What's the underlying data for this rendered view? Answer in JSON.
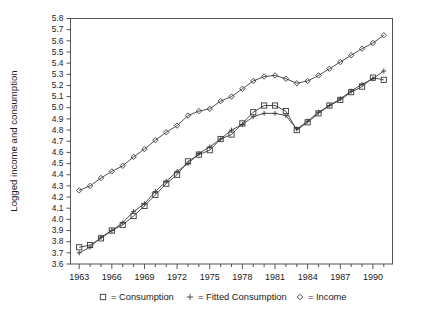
{
  "chart_data": {
    "type": "line",
    "title": "",
    "xlabel": "",
    "ylabel": "Logged income and consumption",
    "xlim": [
      1962.2,
      1991.8
    ],
    "ylim": [
      3.6,
      5.8
    ],
    "grid": false,
    "legend_position": "bottom",
    "y_ticks": [
      "3.6",
      "3.7",
      "3.8",
      "3.9",
      "4.0",
      "4.1",
      "4.2",
      "4.3",
      "4.4",
      "4.5",
      "4.6",
      "4.7",
      "4.8",
      "4.9",
      "5.0",
      "5.1",
      "5.2",
      "5.3",
      "5.4",
      "5.5",
      "5.6",
      "5.7",
      "5.8"
    ],
    "y_tick_values": [
      3.6,
      3.7,
      3.8,
      3.9,
      4.0,
      4.1,
      4.2,
      4.3,
      4.4,
      4.5,
      4.6,
      4.7,
      4.8,
      4.9,
      5.0,
      5.1,
      5.2,
      5.3,
      5.4,
      5.5,
      5.6,
      5.7,
      5.8
    ],
    "x_tick_labels": [
      "1963",
      "1966",
      "1969",
      "1972",
      "1975",
      "1978",
      "1981",
      "1984",
      "1987",
      "1990"
    ],
    "x_tick_values": [
      1963,
      1966,
      1969,
      1972,
      1975,
      1978,
      1981,
      1984,
      1987,
      1990
    ],
    "x_minor_values": [
      1964,
      1965,
      1967,
      1968,
      1970,
      1971,
      1973,
      1974,
      1976,
      1977,
      1979,
      1980,
      1982,
      1983,
      1985,
      1986,
      1988,
      1989,
      1991
    ],
    "x": [
      1963,
      1964,
      1965,
      1966,
      1967,
      1968,
      1969,
      1970,
      1971,
      1972,
      1973,
      1974,
      1975,
      1976,
      1977,
      1978,
      1979,
      1980,
      1981,
      1982,
      1983,
      1984,
      1985,
      1986,
      1987,
      1988,
      1989,
      1990,
      1991
    ],
    "series": [
      {
        "name": "Consumption",
        "marker": "square",
        "legend_label": "= Consumption",
        "values": [
          3.75,
          3.77,
          3.83,
          3.9,
          3.95,
          4.03,
          4.12,
          4.22,
          4.32,
          4.4,
          4.52,
          4.58,
          4.62,
          4.72,
          4.76,
          4.86,
          4.96,
          5.02,
          5.02,
          4.97,
          4.8,
          4.87,
          4.95,
          5.02,
          5.07,
          5.14,
          5.19,
          5.27,
          5.25
        ]
      },
      {
        "name": "Fitted Consumption",
        "marker": "plus",
        "legend_label": "= Fitted Consumption",
        "values": [
          3.7,
          3.75,
          3.84,
          3.9,
          3.97,
          4.07,
          4.14,
          4.25,
          4.34,
          4.43,
          4.5,
          4.59,
          4.65,
          4.72,
          4.8,
          4.85,
          4.92,
          4.95,
          4.95,
          4.93,
          4.81,
          4.88,
          4.96,
          5.02,
          5.08,
          5.15,
          5.21,
          5.26,
          5.33
        ]
      },
      {
        "name": "Income",
        "marker": "diamond",
        "legend_label": "= Income",
        "values": [
          4.26,
          4.3,
          4.37,
          4.43,
          4.48,
          4.56,
          4.63,
          4.71,
          4.78,
          4.84,
          4.93,
          4.97,
          4.99,
          5.06,
          5.1,
          5.17,
          5.24,
          5.28,
          5.29,
          5.26,
          5.22,
          5.24,
          5.29,
          5.35,
          5.41,
          5.47,
          5.53,
          5.58,
          5.65
        ]
      }
    ],
    "legend_marker_glyphs": {
      "square": "square",
      "plus": "plus",
      "diamond": "diamond"
    },
    "legend_equals": "="
  }
}
